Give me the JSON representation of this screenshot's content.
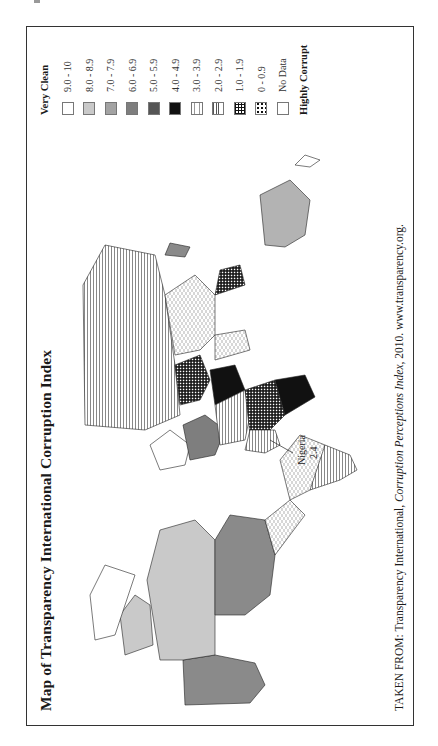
{
  "page": {
    "title": "Map of Transparency International Corruption Index",
    "caption_prefix": "TAKEN FROM: Transparency International, ",
    "caption_italic": "Corruption Perceptions Index",
    "caption_suffix": ", 2010. www.transparency.org."
  },
  "legend": {
    "top_label": "Very Clean",
    "bottom_label": "Highly Corrupt",
    "items": [
      {
        "label": "9.0 - 10",
        "pattern": "white",
        "color": "#ffffff"
      },
      {
        "label": "8.0 - 8.9",
        "pattern": "light-gray",
        "color": "#c9c9c9"
      },
      {
        "label": "7.0 - 7.9",
        "pattern": "mid-gray",
        "color": "#a3a3a3"
      },
      {
        "label": "6.0 - 6.9",
        "pattern": "dark-gray",
        "color": "#7e7e7e"
      },
      {
        "label": "5.0 - 5.9",
        "pattern": "darker-gray",
        "color": "#555555"
      },
      {
        "label": "4.0 - 4.9",
        "pattern": "black",
        "color": "#111111"
      },
      {
        "label": "3.0 - 3.9",
        "pattern": "dashed",
        "color": "#ffffff"
      },
      {
        "label": "2.0 - 2.9",
        "pattern": "horizontal-lines",
        "color": "#ffffff"
      },
      {
        "label": "1.0 - 1.9",
        "pattern": "grid",
        "color": "#ffffff"
      },
      {
        "label": "0 - 0.9",
        "pattern": "dots",
        "color": "#ffffff"
      },
      {
        "label": "No Data",
        "pattern": "white",
        "color": "#ffffff"
      }
    ]
  },
  "annotations": {
    "nigeria_name": "Nigeria",
    "nigeria_value": "2.4"
  },
  "regions": [
    {
      "name": "Alaska (USA)",
      "band": "7.0 - 7.9"
    },
    {
      "name": "Canada",
      "band": "8.0 - 8.9"
    },
    {
      "name": "United States",
      "band": "7.0 - 7.9"
    },
    {
      "name": "Greenland",
      "band": "No Data"
    },
    {
      "name": "Mexico",
      "band": "3.0 - 3.9"
    },
    {
      "name": "South America (north/Brazil)",
      "band": "3.0 - 3.9"
    },
    {
      "name": "South America (south/Argentina)",
      "band": "2.0 - 2.9"
    },
    {
      "name": "Chile",
      "band": "7.0 - 7.9"
    },
    {
      "name": "Scandinavia",
      "band": "9.0 - 10"
    },
    {
      "name": "Western Europe",
      "band": "7.0 - 7.9"
    },
    {
      "name": "Russia",
      "band": "2.0 - 2.9"
    },
    {
      "name": "Central Asia",
      "band": "1.0 - 1.9"
    },
    {
      "name": "China",
      "band": "3.0 - 3.9"
    },
    {
      "name": "India",
      "band": "3.0 - 3.9"
    },
    {
      "name": "Saudi Arabia",
      "band": "4.0 - 4.9"
    },
    {
      "name": "Africa (central)",
      "band": "1.0 - 1.9"
    },
    {
      "name": "Africa (west)",
      "band": "2.0 - 2.9"
    },
    {
      "name": "Southern Africa",
      "band": "4.0 - 4.9"
    },
    {
      "name": "Australia",
      "band": "8.0 - 8.9"
    },
    {
      "name": "Japan",
      "band": "7.0 - 7.9"
    }
  ]
}
